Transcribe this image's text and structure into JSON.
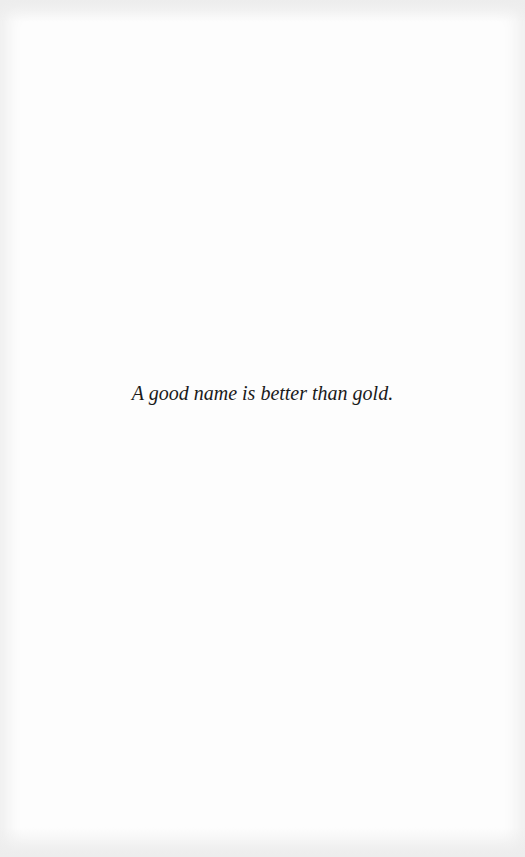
{
  "page": {
    "epigraph": "A good name is better than gold."
  }
}
